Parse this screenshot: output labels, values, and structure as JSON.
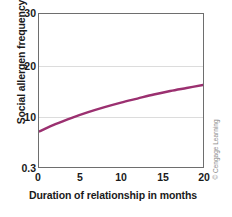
{
  "chart_data": {
    "type": "line",
    "title": "",
    "xlabel": "Duration of relationship in months",
    "ylabel": "Social allergen frequency",
    "xlim": [
      0,
      20
    ],
    "ylim": [
      0.3,
      30
    ],
    "xticks": [
      "0",
      "5",
      "10",
      "15",
      "20"
    ],
    "yticks": [
      "0.3",
      "10",
      "20",
      "30"
    ],
    "grid": true,
    "legend": null,
    "series": [
      {
        "name": "Social allergen frequency",
        "color": "#9B3070",
        "x": [
          0,
          2,
          4,
          6,
          8,
          10,
          12,
          14,
          16,
          18,
          20
        ],
        "values": [
          7.0,
          8.4,
          9.6,
          10.7,
          11.7,
          12.6,
          13.4,
          14.2,
          14.9,
          15.5,
          16.1
        ]
      }
    ]
  },
  "credit": {
    "text": "© Cengage Learning"
  }
}
